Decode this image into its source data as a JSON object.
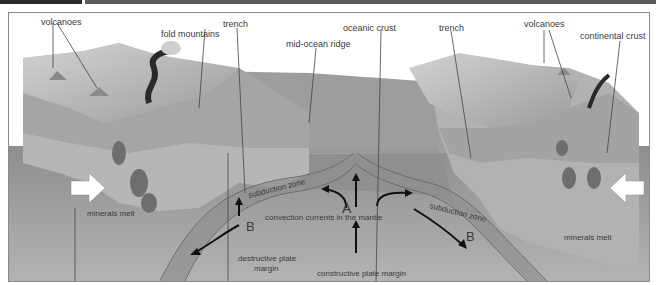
{
  "header": {
    "left_bar_color": "#2b2b2b",
    "right_bar_color": "#5a5a5a"
  },
  "diagram": {
    "labels": {
      "volcanoes_left": "volcanoes",
      "fold_mountains": "fold mountains",
      "trench_left": "trench",
      "mid_ocean_ridge": "mid-ocean ridge",
      "oceanic_crust": "oceanic crust",
      "trench_right": "trench",
      "volcanoes_right": "volcanoes",
      "continental_crust": "continental crust",
      "minerals_melt_left": "minerals melt",
      "minerals_melt_right": "minerals melt",
      "subduction_zone_left": "subduction zone",
      "subduction_zone_right": "subduction zone",
      "convection_currents": "convection currents in the mantle",
      "destructive_margin_line1": "destructive plate",
      "destructive_margin_line2": "margin",
      "constructive_margin": "constructive plate margin",
      "marker_a": "A",
      "marker_b_left": "B",
      "marker_b_right": "B"
    },
    "colors": {
      "sky": "#ffffff",
      "ocean": "#9a9a9a",
      "mantle": "#a8a8a8",
      "plate": "#8c8c8c",
      "land": "#c4c4c4",
      "text": "#3a3a3a"
    }
  }
}
